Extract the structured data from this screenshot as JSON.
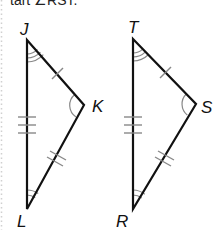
{
  "caption": "tart ∠RST.",
  "colors": {
    "side": "#111111",
    "arc": "#888888",
    "tick": "#888888",
    "dotted_edge": "#d0d0d0"
  },
  "triangles": [
    {
      "name": "JKL",
      "vertices": {
        "J": [
          27,
          40
        ],
        "K": [
          84,
          105
        ],
        "L": [
          27,
          209
        ]
      },
      "labels": {
        "J": "J",
        "K": "K",
        "L": "L"
      },
      "side_marks": {
        "JK": 1,
        "KL": 2,
        "JL": 3
      },
      "angle_marks": {
        "J": 3,
        "K": 1,
        "L": 2
      }
    },
    {
      "name": "TSR",
      "vertices": {
        "T": [
          133,
          39
        ],
        "S": [
          196,
          104
        ],
        "R": [
          133,
          209
        ]
      },
      "labels": {
        "T": "T",
        "S": "S",
        "R": "R"
      },
      "side_marks": {
        "TS": 1,
        "SR": 2,
        "TR": 3
      },
      "angle_marks": {
        "T": 3,
        "S": 1,
        "R": 2
      }
    }
  ]
}
